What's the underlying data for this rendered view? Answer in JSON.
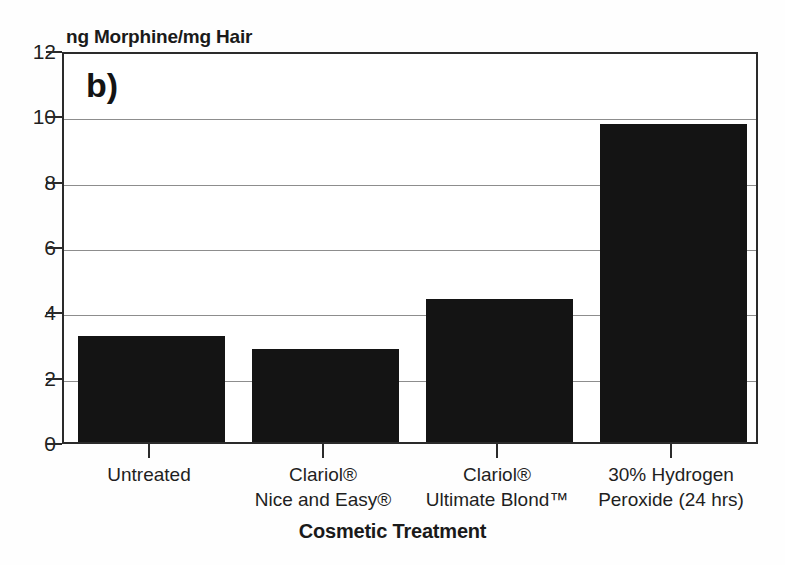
{
  "chart_data": {
    "type": "bar",
    "title": "",
    "panel_label": "b)",
    "xlabel": "Cosmetic Treatment",
    "ylabel": "ng Morphine/mg Hair",
    "categories": [
      "Untreated",
      "Clariol® Nice and Easy®",
      "Clariol® Ultimate Blond™",
      "30% Hydrogen Peroxide (24 hrs)"
    ],
    "category_lines": [
      [
        "Untreated",
        ""
      ],
      [
        "Clariol®",
        "Nice and Easy®"
      ],
      [
        "Clariol®",
        "Ultimate Blond™"
      ],
      [
        "30% Hydrogen",
        "Peroxide (24 hrs)"
      ]
    ],
    "values": [
      3.26,
      2.85,
      4.38,
      9.72
    ],
    "ylim": [
      0,
      12
    ],
    "yticks": [
      0,
      2,
      4,
      6,
      8,
      10,
      12
    ],
    "ytick_labels": [
      "0",
      "2",
      "4",
      "6",
      "8",
      "10",
      "12"
    ],
    "grid": true,
    "grid_axis": "y",
    "legend": false,
    "bar_color": "#141414",
    "axis_color": "#2b2b2b",
    "grid_color": "#8d8d8d",
    "background_color": "#fefefe"
  }
}
